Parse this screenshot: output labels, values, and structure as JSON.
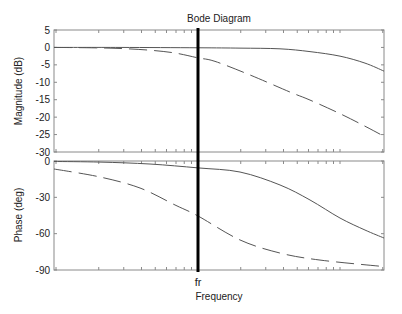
{
  "title": "Bode Diagram",
  "colors": {
    "axes": "#8a8a8a",
    "curve": "#555555",
    "marker": "#000000",
    "text": "#222222"
  },
  "chart_data": [
    {
      "type": "line",
      "panel": "magnitude",
      "title": "Bode Diagram",
      "xlabel": "Frequency",
      "ylabel": "Magnitude (dB)",
      "xscale": "log",
      "xlim_px": [
        54,
        384
      ],
      "ylim": [
        -30,
        5
      ],
      "yticks": [
        5,
        0,
        -5,
        -10,
        -15,
        -20,
        -25,
        -30
      ],
      "grid": false,
      "marker": {
        "label": "fr",
        "x_px": 198
      },
      "series": [
        {
          "name": "solid",
          "style": "solid",
          "x_px": [
            54,
            120,
            198,
            240,
            280,
            310,
            340,
            365,
            384
          ],
          "values": [
            0,
            0,
            -0.1,
            -0.2,
            -0.4,
            -1.2,
            -2.5,
            -4.5,
            -6.8
          ]
        },
        {
          "name": "dashed",
          "style": "dashed",
          "x_px": [
            54,
            90,
            120,
            150,
            175,
            198,
            215,
            250,
            290,
            310,
            340,
            365,
            384
          ],
          "values": [
            0,
            -0.1,
            -0.3,
            -0.8,
            -1.6,
            -3.0,
            -4.0,
            -7.9,
            -12.8,
            -15.1,
            -19.0,
            -22.6,
            -25.5
          ]
        }
      ]
    },
    {
      "type": "line",
      "panel": "phase",
      "xlabel": "Frequency",
      "ylabel": "Phase (deg)",
      "xscale": "log",
      "xlim_px": [
        54,
        384
      ],
      "ylim": [
        -90,
        0
      ],
      "yticks": [
        0,
        -30,
        -60,
        -90
      ],
      "grid": false,
      "marker": {
        "label": "fr",
        "x_px": 198
      },
      "series": [
        {
          "name": "solid",
          "style": "solid",
          "x_px": [
            54,
            100,
            150,
            198,
            240,
            280,
            310,
            340,
            365,
            384
          ],
          "values": [
            -0.4,
            -0.9,
            -2.5,
            -5.7,
            -9.1,
            -19.8,
            -32.2,
            -47.1,
            -57,
            -63.6
          ]
        },
        {
          "name": "dashed",
          "style": "dashed",
          "x_px": [
            54,
            100,
            140,
            175,
            198,
            240,
            280,
            320,
            384
          ],
          "values": [
            -6.6,
            -13.2,
            -22.3,
            -36.3,
            -45.4,
            -65.2,
            -76.0,
            -81.8,
            -87.2
          ]
        }
      ]
    }
  ]
}
